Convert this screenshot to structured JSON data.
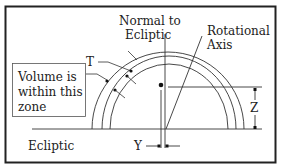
{
  "diagram": {
    "type": "geometric-schematic",
    "labels": {
      "normal_line1": "Normal to",
      "normal_line2": "Ecliptic",
      "rotational_line1": "Rotational",
      "rotational_line2": "Axis",
      "t": "T",
      "volume_line1": "Volume is",
      "volume_line2": "within this",
      "volume_line3": "zone",
      "ecliptic": "Ecliptic",
      "y": "Y",
      "z": "Z"
    },
    "colors": {
      "line": "#333333",
      "frame": "#222222",
      "background": "#ffffff"
    }
  }
}
